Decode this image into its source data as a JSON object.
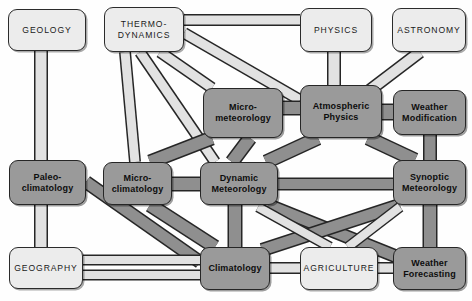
{
  "diagram": {
    "colors": {
      "background": "#fefefe",
      "light_box_fill": "#ececec",
      "dark_box_fill": "#9a9a9a",
      "outline": "#262626",
      "light_link": "#e2e2e2",
      "dark_link": "#8f8f8f"
    },
    "nodes": [
      {
        "id": "geology",
        "label": "GEOLOGY",
        "style": "light",
        "x": 8,
        "y": 9,
        "w": 78,
        "h": 42
      },
      {
        "id": "thermo",
        "label": "THERMO-\nDYNAMICS",
        "style": "light",
        "x": 104,
        "y": 7,
        "w": 80,
        "h": 45
      },
      {
        "id": "physics",
        "label": "PHYSICS",
        "style": "light",
        "x": 300,
        "y": 8,
        "w": 72,
        "h": 44
      },
      {
        "id": "astronomy",
        "label": "ASTRONOMY",
        "style": "light",
        "x": 392,
        "y": 8,
        "w": 74,
        "h": 44
      },
      {
        "id": "micromet",
        "label": "Micro-\nmeteorology",
        "style": "dark",
        "x": 203,
        "y": 88,
        "w": 80,
        "h": 50
      },
      {
        "id": "atmosphys",
        "label": "Atmospheric\nPhysics",
        "style": "dark",
        "x": 300,
        "y": 85,
        "w": 82,
        "h": 53
      },
      {
        "id": "weathermod",
        "label": "Weather\nModification",
        "style": "dark",
        "x": 393,
        "y": 90,
        "w": 73,
        "h": 45
      },
      {
        "id": "paleo",
        "label": "Paleo-\nclimatology",
        "style": "dark",
        "x": 9,
        "y": 160,
        "w": 77,
        "h": 45
      },
      {
        "id": "microclim",
        "label": "Micro-\nclimatology",
        "style": "dark",
        "x": 103,
        "y": 162,
        "w": 69,
        "h": 43
      },
      {
        "id": "dynamicmet",
        "label": "Dynamic\nMeteorology",
        "style": "dark",
        "x": 200,
        "y": 162,
        "w": 78,
        "h": 43
      },
      {
        "id": "synoptic",
        "label": "Synoptic\nMeteorology",
        "style": "dark",
        "x": 393,
        "y": 160,
        "w": 73,
        "h": 45
      },
      {
        "id": "geography",
        "label": "GEOGRAPHY",
        "style": "light",
        "x": 9,
        "y": 247,
        "w": 74,
        "h": 42
      },
      {
        "id": "climatology",
        "label": "Climatology",
        "style": "dark",
        "x": 200,
        "y": 247,
        "w": 70,
        "h": 43
      },
      {
        "id": "agriculture",
        "label": "AGRICULTURE",
        "style": "light",
        "x": 300,
        "y": 247,
        "w": 78,
        "h": 43
      },
      {
        "id": "forecasting",
        "label": "Weather\nForecasting",
        "style": "dark",
        "x": 393,
        "y": 247,
        "w": 73,
        "h": 43
      }
    ],
    "links": [
      {
        "from": "geology",
        "to": "paleo",
        "tone": "light",
        "path": "M 41 51 L 41 160",
        "width": 11
      },
      {
        "from": "paleo",
        "to": "geography",
        "tone": "light",
        "path": "M 41 205 L 41 247",
        "width": 11
      },
      {
        "from": "paleo",
        "to": "climatology",
        "tone": "dark",
        "path": "M 86 182 L 200 262",
        "width": 11
      },
      {
        "from": "geography",
        "to": "climatology",
        "tone": "light",
        "path": "M 83 260 L 200 260",
        "width": 8
      },
      {
        "from": "geography",
        "to": "climatology",
        "tone": "light",
        "path": "M 83 275 L 200 275",
        "width": 8
      },
      {
        "from": "thermo",
        "to": "physics",
        "tone": "light",
        "path": "M 184 20 L 300 20",
        "width": 9
      },
      {
        "from": "thermo",
        "to": "atmosphys",
        "tone": "light",
        "path": "M 184 33 L 300 100",
        "width": 9
      },
      {
        "from": "thermo",
        "to": "micromet",
        "tone": "light",
        "path": "M 160 52 L 212 88",
        "width": 9
      },
      {
        "from": "thermo",
        "to": "dynamicmet",
        "tone": "light",
        "path": "M 140 52 L 215 162",
        "width": 9
      },
      {
        "from": "thermo",
        "to": "microclim",
        "tone": "light",
        "path": "M 125 52 L 135 162",
        "width": 9
      },
      {
        "from": "physics",
        "to": "atmosphys",
        "tone": "light",
        "path": "M 334 52 L 334 85",
        "width": 11
      },
      {
        "from": "astronomy",
        "to": "atmosphys",
        "tone": "light",
        "path": "M 420 52 L 370 90",
        "width": 10
      },
      {
        "from": "micromet",
        "to": "atmosphys",
        "tone": "dark",
        "path": "M 283 108 L 300 108",
        "width": 12
      },
      {
        "from": "micromet",
        "to": "dynamicmet",
        "tone": "dark",
        "path": "M 250 138 L 232 162",
        "width": 12
      },
      {
        "from": "micromet",
        "to": "microclim",
        "tone": "dark",
        "path": "M 212 138 L 150 162",
        "width": 12
      },
      {
        "from": "atmosphys",
        "to": "weathermod",
        "tone": "dark",
        "path": "M 382 112 L 393 112",
        "width": 14
      },
      {
        "from": "atmosphys",
        "to": "dynamicmet",
        "tone": "dark",
        "path": "M 318 138 L 266 162",
        "width": 12
      },
      {
        "from": "atmosphys",
        "to": "synoptic",
        "tone": "dark",
        "path": "M 368 138 L 415 160",
        "width": 12
      },
      {
        "from": "weathermod",
        "to": "synoptic",
        "tone": "dark",
        "path": "M 430 135 L 430 160",
        "width": 11
      },
      {
        "from": "microclim",
        "to": "dynamicmet",
        "tone": "dark",
        "path": "M 172 184 L 200 184",
        "width": 12
      },
      {
        "from": "microclim",
        "to": "climatology",
        "tone": "dark",
        "path": "M 150 205 L 215 247",
        "width": 12
      },
      {
        "from": "dynamicmet",
        "to": "synoptic",
        "tone": "dark",
        "path": "M 278 184 L 393 184",
        "width": 10
      },
      {
        "from": "dynamicmet",
        "to": "climatology",
        "tone": "dark",
        "path": "M 235 205 L 235 247",
        "width": 12
      },
      {
        "from": "dynamicmet",
        "to": "forecasting",
        "tone": "dark",
        "path": "M 268 205 L 400 258",
        "width": 11
      },
      {
        "from": "climatology",
        "to": "synoptic",
        "tone": "dark",
        "path": "M 262 250 L 400 205",
        "width": 11
      },
      {
        "from": "climatology",
        "to": "agriculture",
        "tone": "light",
        "path": "M 270 268 L 300 268",
        "width": 9
      },
      {
        "from": "agriculture",
        "to": "forecasting",
        "tone": "light",
        "path": "M 378 268 L 393 268",
        "width": 9
      },
      {
        "from": "agriculture",
        "to": "dynamicmet",
        "tone": "light",
        "path": "M 330 247 L 258 207",
        "width": 8
      },
      {
        "from": "agriculture",
        "to": "synoptic",
        "tone": "light",
        "path": "M 348 247 L 400 207",
        "width": 8
      },
      {
        "from": "synoptic",
        "to": "forecasting",
        "tone": "dark",
        "path": "M 430 205 L 430 247",
        "width": 12
      }
    ]
  }
}
